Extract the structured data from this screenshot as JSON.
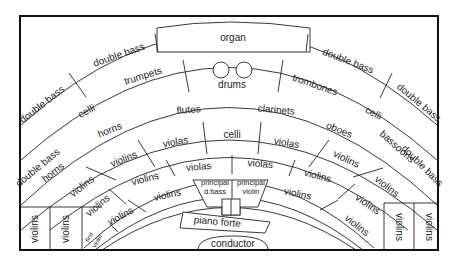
{
  "diagram": {
    "sections": {
      "organ": "organ",
      "drums": "drums",
      "double_bass_outer_left_top": "double bass",
      "double_bass_outer_left": "double bass",
      "double_bass_outer_right_top": "double bass",
      "double_bass_outer_right": "double bass",
      "double_bass_left_mid": "double bass",
      "double_bass_right_mid": "double bass",
      "trumpets": "trumpets",
      "trombones": "trombones",
      "celli_left": "celli",
      "celli_right": "celli",
      "flutes": "flutes",
      "clarinets": "clarinets",
      "horns_upper": "horns",
      "horns_lower": "horns",
      "oboes": "oboes",
      "bassoons": "bassoons",
      "celli_center": "celli",
      "violas_left": "violas",
      "violas_right": "violas",
      "violas_inner_left": "violas",
      "violas_inner_right": "violas",
      "violins_l1": "violins",
      "violins_l2": "violins",
      "violins_l3": "violins",
      "violins_l4": "violins",
      "violins_l5": "violins",
      "violins_l6": "violins",
      "violins_r1": "violins",
      "violins_r2": "violins",
      "violins_r3": "violins",
      "violins_r4": "violins",
      "violins_r5": "violins",
      "violins_r6": "violins",
      "violins_box_l1": "violins",
      "violins_box_l2": "violins",
      "violins_box_r1": "violins",
      "violins_box_r2": "violins",
      "first_violin": "first violin",
      "first_violin_line1": "first",
      "first_violin_line2": "violin",
      "principal_dbass_line1": "principal",
      "principal_dbass_line2": "d.bass",
      "principal_violin_line1": "principal",
      "principal_violin_line2": "violin",
      "piano_forte": "piano forte",
      "conductor": "conductor"
    }
  }
}
